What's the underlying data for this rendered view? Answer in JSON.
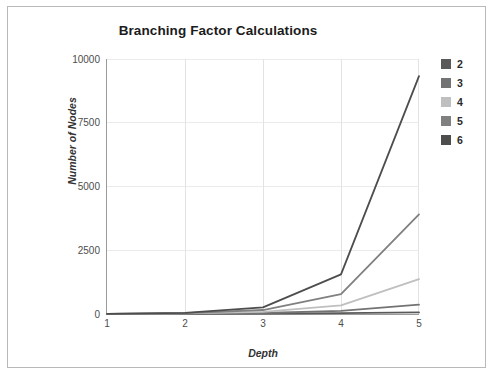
{
  "chart_data": {
    "type": "line",
    "title": "Branching Factor Calculations",
    "xlabel": "Depth",
    "ylabel": "Number of Nodes",
    "x": [
      1,
      2,
      3,
      4,
      5
    ],
    "xlim": [
      1,
      5
    ],
    "ylim": [
      0,
      10000
    ],
    "xticks": [
      "1",
      "2",
      "3",
      "4",
      "5"
    ],
    "yticks": [
      "0",
      "2500",
      "5000",
      "7500",
      "10000"
    ],
    "grid": true,
    "legend_position": "right",
    "series": [
      {
        "name": "2",
        "color": "#595959",
        "values": [
          3,
          7,
          15,
          31,
          63
        ]
      },
      {
        "name": "3",
        "color": "#737373",
        "values": [
          4,
          13,
          40,
          121,
          364
        ]
      },
      {
        "name": "4",
        "color": "#bfbfbf",
        "values": [
          5,
          21,
          85,
          341,
          1365
        ]
      },
      {
        "name": "5",
        "color": "#808080",
        "values": [
          6,
          31,
          156,
          781,
          3906
        ]
      },
      {
        "name": "6",
        "color": "#4d4d4d",
        "values": [
          7,
          43,
          259,
          1555,
          9331
        ]
      }
    ]
  },
  "legend": {
    "items": [
      {
        "label": "2",
        "color": "#595959"
      },
      {
        "label": "3",
        "color": "#737373"
      },
      {
        "label": "4",
        "color": "#bfbfbf"
      },
      {
        "label": "5",
        "color": "#808080"
      },
      {
        "label": "6",
        "color": "#4d4d4d"
      }
    ]
  },
  "axis": {
    "y_ticks": [
      "10000",
      "7500",
      "5000",
      "2500",
      "0"
    ],
    "x_ticks": [
      "1",
      "2",
      "3",
      "4",
      "5"
    ]
  }
}
